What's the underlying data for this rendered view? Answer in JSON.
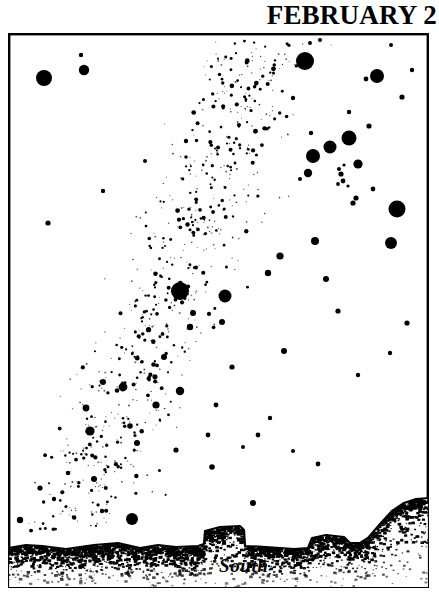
{
  "title": "FEBRUARY 2",
  "horizon_label": "South",
  "colors": {
    "ink": "#000000",
    "sky": "#ffffff",
    "frame": "#000000"
  },
  "frame": {
    "x": 8,
    "y": 33,
    "width": 421,
    "height": 555,
    "stroke_width": 2.4
  },
  "chart_data": {
    "type": "scatter",
    "title": "FEBRUARY 2",
    "xlabel": "",
    "ylabel": "",
    "subtitle": "Evening sky star chart facing south",
    "grid": false,
    "legend": "none",
    "xlim": [
      0,
      421
    ],
    "ylim": [
      0,
      555
    ],
    "annotations": [
      {
        "text": "South",
        "x": 219,
        "y": 530
      }
    ],
    "series": [
      {
        "name": "bright-stars",
        "comment": "x,y in frame-local pixels; r = drawn radius (magnitude proxy)",
        "points": [
          [
            36,
            45,
            8.0
          ],
          [
            76,
            37,
            5.2
          ],
          [
            73,
            22,
            2.2
          ],
          [
            297,
            28,
            9.0
          ],
          [
            302,
            10,
            2.0
          ],
          [
            312,
            7,
            2.0
          ],
          [
            358,
            46,
            2.4
          ],
          [
            369,
            43,
            7.0
          ],
          [
            383,
            12,
            2.0
          ],
          [
            341,
            105,
            7.5
          ],
          [
            322,
            114,
            6.5
          ],
          [
            305,
            123,
            7.0
          ],
          [
            300,
            140,
            4.2
          ],
          [
            350,
            131,
            4.6
          ],
          [
            361,
            93,
            2.6
          ],
          [
            341,
            79,
            2.2
          ],
          [
            394,
            64,
            2.6
          ],
          [
            404,
            37,
            2.2
          ],
          [
            303,
            100,
            2.2
          ],
          [
            285,
            65,
            2.2
          ],
          [
            389,
            176,
            8.5
          ],
          [
            365,
            156,
            2.4
          ],
          [
            348,
            165,
            2.6
          ],
          [
            292,
            146,
            2.0
          ],
          [
            330,
            151,
            1.9
          ],
          [
            335,
            148,
            2.4
          ],
          [
            333,
            141,
            2.6
          ],
          [
            331,
            136,
            2.0
          ],
          [
            336,
            132,
            1.6
          ],
          [
            340,
            153,
            1.6
          ],
          [
            345,
            170,
            2.6
          ],
          [
            40,
            190,
            2.6
          ],
          [
            95,
            158,
            2.2
          ],
          [
            137,
            128,
            2.0
          ],
          [
            178,
            108,
            2.2
          ],
          [
            231,
            92,
            2.0
          ],
          [
            172,
            258,
            9.0
          ],
          [
            217,
            263,
            6.5
          ],
          [
            185,
            280,
            3.0
          ],
          [
            182,
            294,
            3.2
          ],
          [
            95,
            349,
            3.0
          ],
          [
            156,
            324,
            3.0
          ],
          [
            214,
            289,
            3.0
          ],
          [
            272,
            223,
            3.6
          ],
          [
            260,
            240,
            3.2
          ],
          [
            307,
            208,
            4.0
          ],
          [
            318,
            246,
            3.0
          ],
          [
            330,
            278,
            2.6
          ],
          [
            383,
            210,
            6.0
          ],
          [
            387,
            176,
            2.2
          ],
          [
            276,
            318,
            3.0
          ],
          [
            224,
            334,
            2.6
          ],
          [
            115,
            354,
            4.4
          ],
          [
            78,
            375,
            3.4
          ],
          [
            148,
            372,
            3.6
          ],
          [
            122,
            393,
            2.8
          ],
          [
            172,
            358,
            4.2
          ],
          [
            208,
            372,
            2.4
          ],
          [
            82,
            398,
            4.6
          ],
          [
            129,
            410,
            3.0
          ],
          [
            124,
            486,
            6.0
          ],
          [
            86,
            446,
            3.0
          ],
          [
            32,
            455,
            2.6
          ],
          [
            60,
            440,
            2.2
          ],
          [
            262,
            385,
            2.2
          ],
          [
            250,
            402,
            2.4
          ],
          [
            235,
            414,
            2.0
          ],
          [
            200,
            402,
            2.4
          ],
          [
            285,
            418,
            2.0
          ],
          [
            168,
            417,
            2.6
          ],
          [
            204,
            434,
            2.8
          ],
          [
            310,
            431,
            2.4
          ],
          [
            46,
            466,
            2.2
          ],
          [
            94,
            478,
            2.2
          ],
          [
            12,
            487,
            3.2
          ],
          [
            245,
            470,
            3.0
          ],
          [
            399,
            290,
            2.6
          ],
          [
            382,
            320,
            2.2
          ],
          [
            350,
            342,
            2.2
          ]
        ]
      },
      {
        "name": "milky-way-band",
        "comment": "dense faint star field, band runs upper-right to lower-left",
        "density": 900,
        "band": {
          "x_top": 0.62,
          "x_bottom": 0.13,
          "half_width": 0.22
        }
      }
    ]
  },
  "horizon": {
    "name": "south-horizon-silhouette",
    "path": "M 0,515 L 18,512 L 34,513 L 58,516 L 86,512 L 110,510 L 132,515 L 150,512 L 168,514 L 190,513 L 196,511 L 197,498 L 212,494 L 232,493 L 236,497 L 237,513 L 258,514 L 286,516 L 300,515 L 304,505 L 318,502 L 336,504 L 342,510 L 352,510 L 360,505 L 372,491 L 384,478 L 396,470 L 408,466 L 421,465 L 421,555 L 0,555 Z"
  }
}
